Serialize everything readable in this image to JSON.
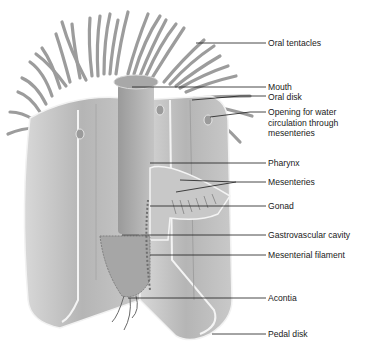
{
  "diagram": {
    "colors": {
      "body": "#b3b3b3",
      "body_light": "#d4d4d4",
      "body_dark": "#8e8e8e",
      "tissue_edge": "#f4f4f4",
      "leader_line": "#1a1a1a",
      "text": "#1a1a1a",
      "background": "#ffffff"
    },
    "labels": [
      {
        "id": "oral-tentacles",
        "text": "Oral tentacles"
      },
      {
        "id": "mouth",
        "text": "Mouth"
      },
      {
        "id": "oral-disk",
        "text": "Oral disk"
      },
      {
        "id": "opening",
        "text": "Opening for water circulation through mesenteries"
      },
      {
        "id": "pharynx",
        "text": "Pharynx"
      },
      {
        "id": "mesenteries",
        "text": "Mesenteries"
      },
      {
        "id": "gonad",
        "text": "Gonad"
      },
      {
        "id": "gastrovascular-cavity",
        "text": "Gastrovascular cavity"
      },
      {
        "id": "mesenterial-filament",
        "text": "Mesenterial filament"
      },
      {
        "id": "acontia",
        "text": "Acontia"
      },
      {
        "id": "pedal-disk",
        "text": "Pedal disk"
      }
    ]
  }
}
